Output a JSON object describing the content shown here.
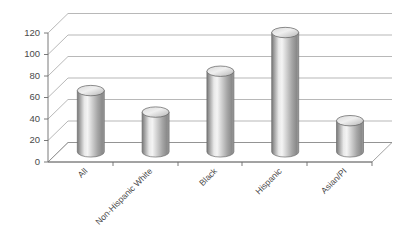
{
  "chart_data": {
    "type": "bar",
    "title": "",
    "subtitle": "",
    "xlabel": "",
    "ylabel": "",
    "categories": [
      "All",
      "Non-Hispanic White",
      "Black",
      "Hispanic",
      "Asian/PI"
    ],
    "values": [
      57,
      37,
      75,
      111,
      29
    ],
    "series": [
      {
        "name": "Rate",
        "values": [
          57,
          37,
          75,
          111,
          29
        ]
      }
    ],
    "ylim": [
      0,
      120
    ],
    "ytick_labels": [
      "0",
      "20",
      "40",
      "60",
      "80",
      "100",
      "120"
    ],
    "ytick_values": [
      0,
      20,
      40,
      60,
      80,
      100,
      120
    ],
    "grid": true,
    "legend": "none",
    "style": "3d-cylinder",
    "annotations": []
  },
  "chart": {
    "ticks": [
      {
        "label": "120",
        "value": 120
      },
      {
        "label": "100",
        "value": 100
      },
      {
        "label": "80",
        "value": 80
      },
      {
        "label": "60",
        "value": 60
      },
      {
        "label": "40",
        "value": 40
      },
      {
        "label": "20",
        "value": 20
      },
      {
        "label": "0",
        "value": 0
      }
    ],
    "bars": [
      {
        "label": "All",
        "value": 57
      },
      {
        "label": "Non-Hispanic White",
        "value": 37
      },
      {
        "label": "Black",
        "value": 75
      },
      {
        "label": "Hispanic",
        "value": 111
      },
      {
        "label": "Asian/PI",
        "value": 29
      }
    ],
    "colors": {
      "grid": "#9a9a9a",
      "axis": "#6b6b6b",
      "text": "#4a4a4a",
      "cylinder_light": "#f2f2f2",
      "cylinder_mid": "#b9b9b9",
      "cylinder_dark": "#6f6f6f",
      "background": "#ffffff"
    }
  }
}
